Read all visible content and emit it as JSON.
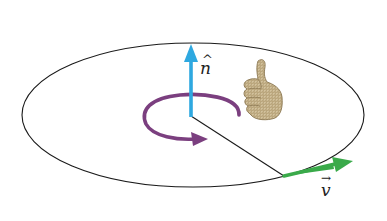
{
  "diagram": {
    "title": "",
    "colors": {
      "ellipse": "#1a1a1a",
      "normal_arrow": "#2ea8e0",
      "rotation_arrow": "#7b3f7f",
      "radius_line": "#1a1a1a",
      "velocity_arrow": "#3aaa4a",
      "hand_fill": "#c8b592",
      "hand_stroke": "#8a7650"
    },
    "labels": {
      "normal": "n",
      "normal_hat": "^",
      "velocity": "v",
      "velocity_arrow": "→"
    },
    "icons": {
      "hand": "thumbs-up-right-hand-icon"
    },
    "geometry": {
      "ellipse": {
        "cx": 193,
        "cy": 115,
        "rx": 171,
        "ry": 72
      },
      "center": {
        "x": 191,
        "y": 116
      },
      "normal_tip": {
        "x": 191,
        "y": 44
      },
      "radius_end": {
        "x": 284,
        "y": 176
      },
      "velocity_tip": {
        "x": 352,
        "y": 162
      }
    }
  }
}
